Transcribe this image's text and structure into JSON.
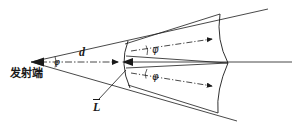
{
  "figure": {
    "type": "optical-beam-geometry-diagram",
    "background_color": "#ffffff",
    "line_color": "#1a1a1a",
    "width": 296,
    "height": 124
  },
  "labels": {
    "transmitter": "发射端",
    "distance": "d",
    "aperture": "L",
    "angle_apex": "φ",
    "angle_upper": "φ",
    "angle_lower": "φ"
  },
  "geometry": {
    "apex": {
      "x": 31,
      "y": 62
    },
    "aperture_arc": {
      "x": 124,
      "y_top": 41,
      "y_bottom": 88,
      "bulge": 5
    },
    "right_arc": {
      "x": 219,
      "y_top": 13,
      "y_bottom": 114,
      "vertex_x": 228,
      "vertex_y": 63
    },
    "axis_line": {
      "x1": 31,
      "y1": 62,
      "x2": 292,
      "y2": 62
    },
    "upper_axis": {
      "x1": 131,
      "y1": 52,
      "x2": 214,
      "y2": 40
    },
    "lower_axis": {
      "x1": 131,
      "y1": 74,
      "x2": 214,
      "y2": 87
    }
  },
  "annotations": {
    "apex_angle_mark": "arc at apex between upper and lower cone edges",
    "upper_cone_angle_mark": "arc near x=150 y=50 on upper sub-cone",
    "lower_cone_angle_mark": "arc near x=150 y=75 on lower sub-cone",
    "leader_line": "from L label up-right to aperture arc"
  }
}
